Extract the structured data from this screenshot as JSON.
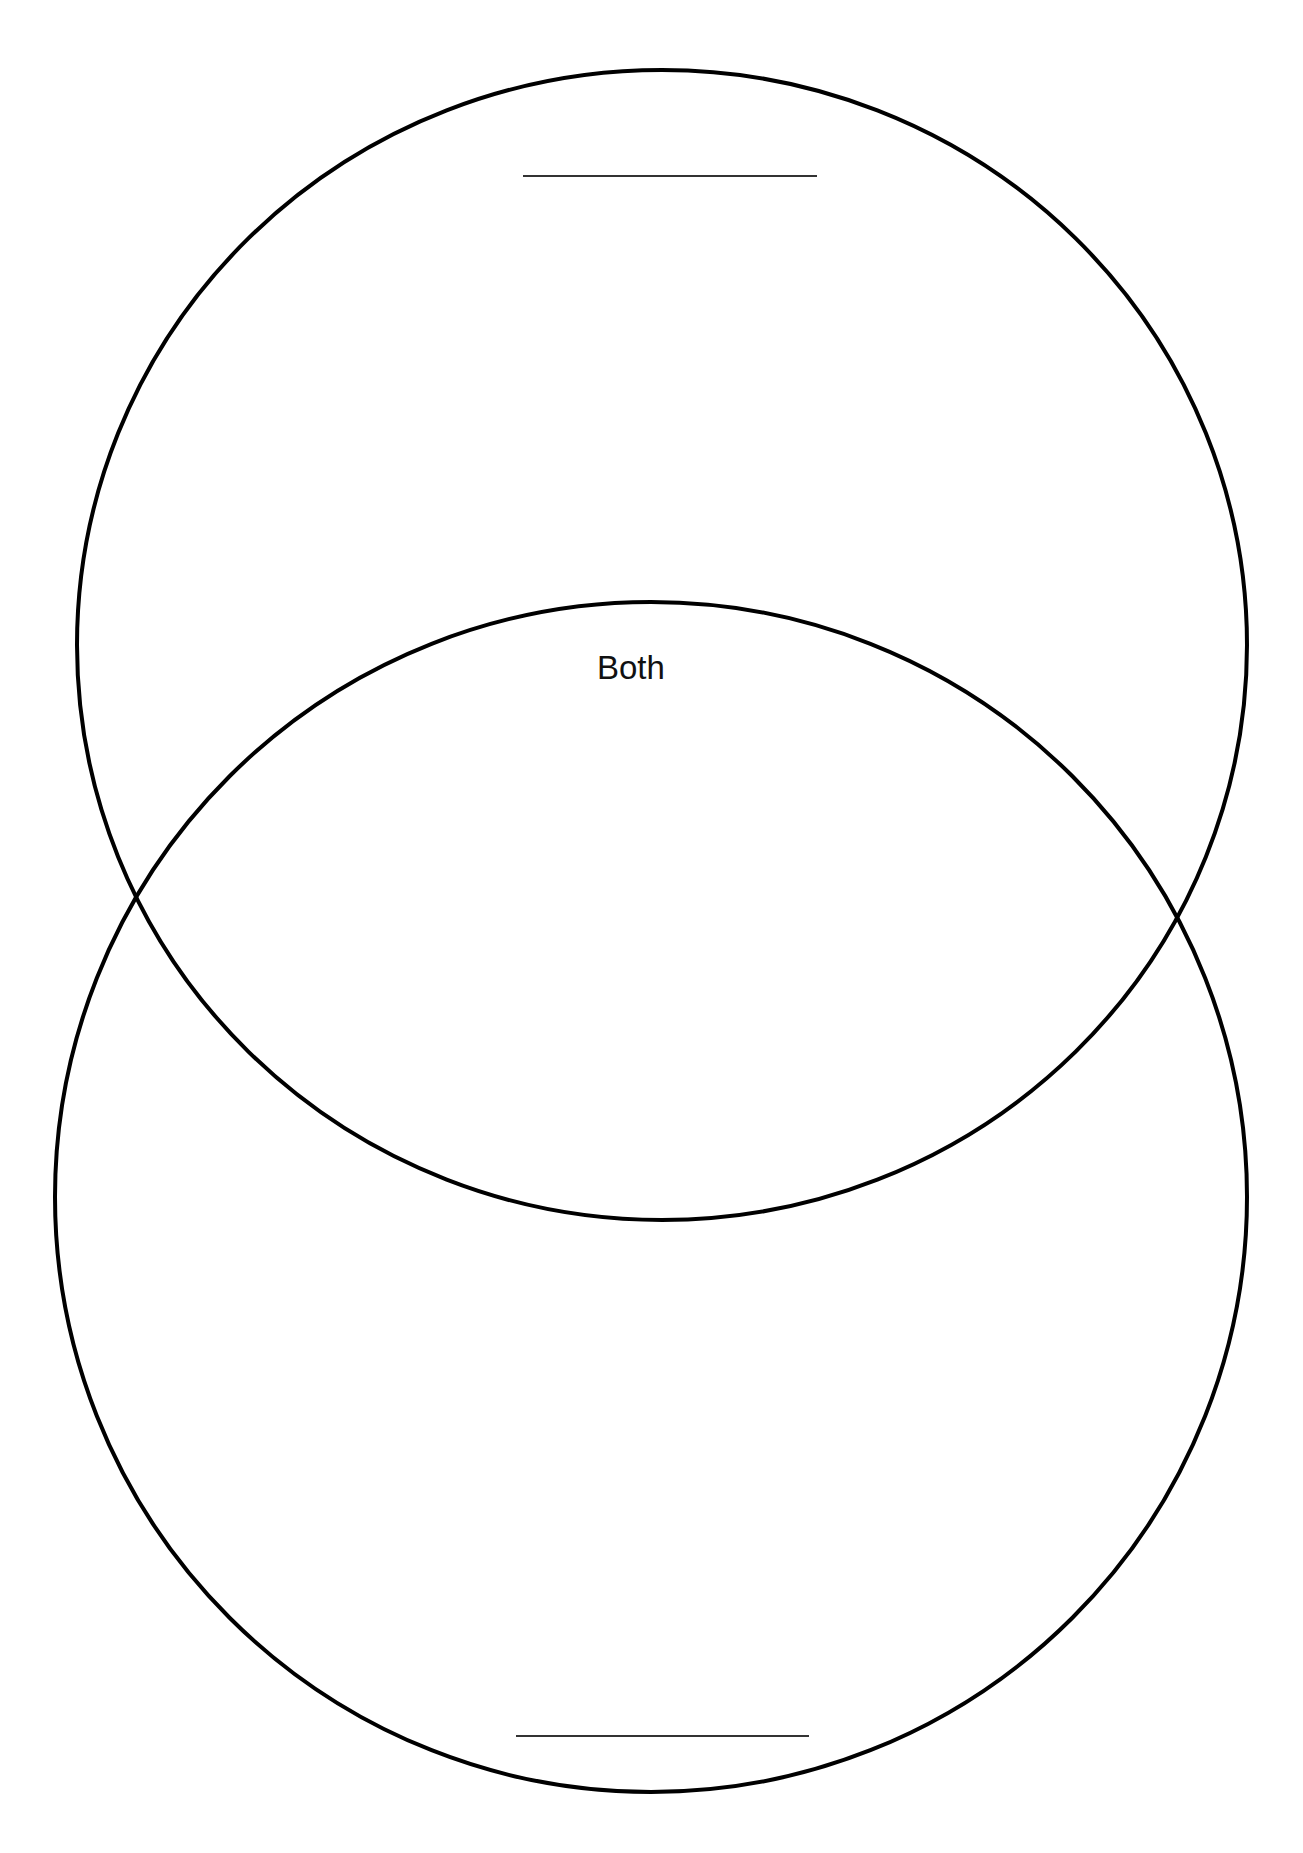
{
  "diagram": {
    "type": "venn",
    "sets": [
      {
        "name": "top-set",
        "title": "",
        "title_placeholder": "blank line"
      },
      {
        "name": "bottom-set",
        "title": "",
        "title_placeholder": "blank line"
      }
    ],
    "intersection_label": "Both",
    "colors": {
      "stroke": "#000000",
      "blank_line": "#333333",
      "text": "#111111",
      "background": "#ffffff"
    }
  }
}
